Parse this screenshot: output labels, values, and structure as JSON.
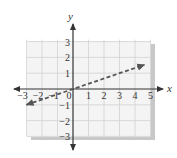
{
  "chart_data": {
    "type": "line",
    "title": "",
    "xlabel": "x",
    "ylabel": "y",
    "xlim": [
      -3,
      5
    ],
    "ylim": [
      -3,
      3
    ],
    "grid": true,
    "x_ticks": [
      "-3",
      "-2",
      "-1",
      "0",
      "1",
      "2",
      "3",
      "4",
      "5"
    ],
    "y_ticks": [
      "-3",
      "-2",
      "-1",
      "1",
      "2",
      "3"
    ],
    "series": [
      {
        "name": "y = (1/3)x",
        "style": "dashed",
        "arrows": "both",
        "points": [
          [
            -3,
            -1
          ],
          [
            0,
            0
          ],
          [
            4.6,
            1.53
          ]
        ]
      }
    ],
    "colors": {
      "line": "#555555",
      "axis": "#333333",
      "grid": "#cfcfcf",
      "panel": "#f2f2f2",
      "shadow": "#c8c8c8"
    }
  }
}
